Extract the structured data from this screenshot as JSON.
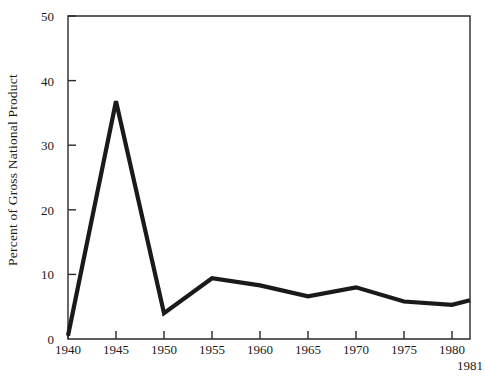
{
  "chart_data": {
    "type": "line",
    "title": "",
    "subtitle": "",
    "xlabel": "",
    "ylabel": "Percent of Gross National Product",
    "x": [
      1940,
      1945,
      1950,
      1955,
      1960,
      1965,
      1970,
      1975,
      1980,
      1981
    ],
    "values": [
      0.5,
      36.8,
      4.0,
      9.4,
      8.3,
      6.6,
      8.0,
      5.8,
      5.3,
      6.0
    ],
    "series": [
      {
        "name": "Percent of Gross National Product",
        "values": [
          0.5,
          36.8,
          4.0,
          9.4,
          8.3,
          6.6,
          8.0,
          5.8,
          5.3,
          6.0
        ]
      }
    ],
    "xlim": [
      1940,
      1981
    ],
    "ylim": [
      0,
      50
    ],
    "x_ticks": [
      1940,
      1945,
      1950,
      1955,
      1960,
      1965,
      1970,
      1975,
      1980
    ],
    "x_tick_labels": [
      "1940",
      "1945",
      "1950",
      "1955",
      "1960",
      "1965",
      "1970",
      "1975",
      "1980"
    ],
    "x_end_tick_label": "1981",
    "y_ticks": [
      0,
      10,
      20,
      30,
      40,
      50
    ],
    "y_tick_labels": [
      "0",
      "10",
      "20",
      "30",
      "40",
      "50"
    ],
    "grid": false,
    "legend": false,
    "legend_position": "none",
    "line_color": "#1a1a1a",
    "axis_color": "#2a2a2a",
    "background_color": "#ffffff",
    "annotations": []
  }
}
